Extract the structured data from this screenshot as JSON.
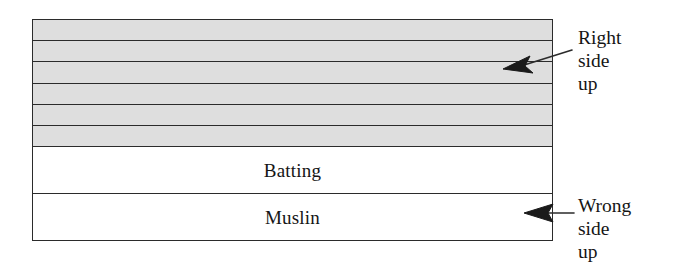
{
  "diagram": {
    "type": "quilt-layer-cross-section",
    "stack": {
      "quilt_top": {
        "name": "quilt-top",
        "fill_color": "#dedede",
        "strip_count": 6,
        "shaded": true
      },
      "layers": [
        {
          "id": "batting",
          "label": "Batting",
          "fill_color": "#ffffff"
        },
        {
          "id": "muslin",
          "label": "Muslin",
          "fill_color": "#ffffff"
        }
      ]
    },
    "annotations": [
      {
        "id": "right-side-up",
        "lines": [
          "Right",
          "side",
          "up"
        ],
        "points_to": "quilt-top",
        "arrow_direction": "left-down"
      },
      {
        "id": "wrong-side-up",
        "lines": [
          "Wrong",
          "side",
          "up"
        ],
        "points_to": "muslin",
        "arrow_direction": "left"
      }
    ],
    "colors": {
      "stroke": "#2b2b2b",
      "shade": "#dedede",
      "background": "#ffffff",
      "text": "#151515"
    }
  }
}
